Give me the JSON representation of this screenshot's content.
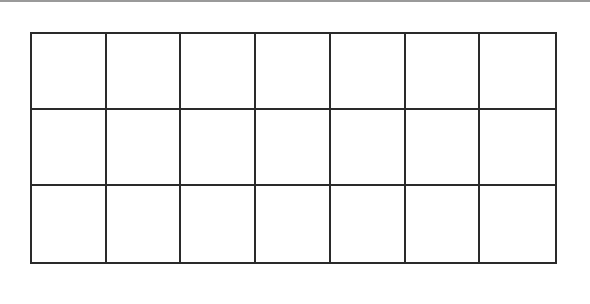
{
  "diagram": {
    "type": "empty-grid",
    "rows": 3,
    "columns": 7,
    "line_color": "#2a2a2a",
    "background": "#ffffff",
    "cells": []
  }
}
